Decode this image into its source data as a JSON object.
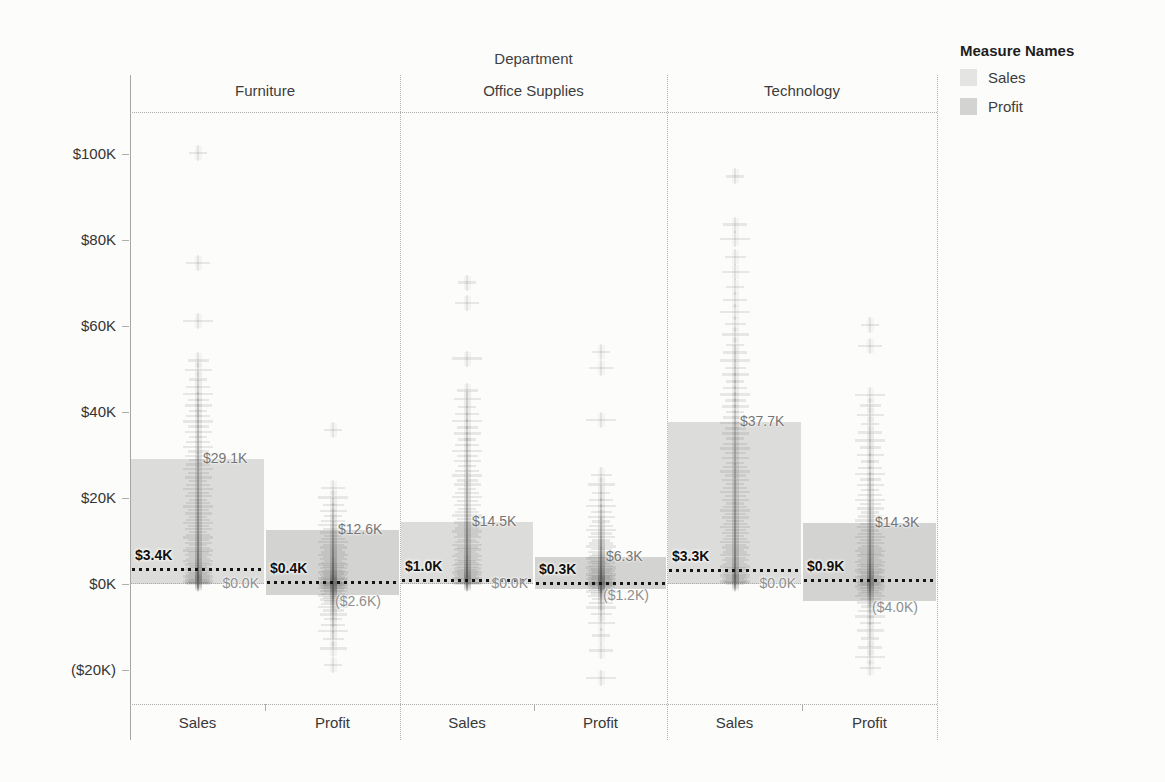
{
  "title": "Department",
  "legend": {
    "title": "Measure Names",
    "entries": [
      {
        "label": "Sales",
        "color": "#e4e4e3"
      },
      {
        "label": "Profit",
        "color": "#d3d3d2"
      }
    ]
  },
  "chart_data": {
    "type": "scatter",
    "title": "Department",
    "subtitle": "",
    "xlabel": "",
    "ylabel": "",
    "legend_position": "top-right",
    "grid": false,
    "ylim": [
      -28,
      110
    ],
    "y_axis": {
      "unit": "$K",
      "ticks": [
        {
          "value": 100,
          "label": "$100K"
        },
        {
          "value": 80,
          "label": "$80K"
        },
        {
          "value": 60,
          "label": "$60K"
        },
        {
          "value": 40,
          "label": "$40K"
        },
        {
          "value": 20,
          "label": "$20K"
        },
        {
          "value": 0,
          "label": "$0K"
        },
        {
          "value": -20,
          "label": "($20K)"
        }
      ]
    },
    "colors": {
      "sales_band": "#dcdcdb",
      "profit_band": "#d3d3d2",
      "mark": "90,90,90",
      "ref_line": "#151515"
    },
    "panels": [
      {
        "department": "Furniture",
        "measures": [
          {
            "name": "Sales",
            "band": {
              "top_value": 29.1,
              "top_label": "$29.1K",
              "bottom_value": 0.0,
              "bottom_label": "$0.0K"
            },
            "ref_line": {
              "value": 3.4,
              "label": "$3.4K"
            },
            "points": [
              100.2,
              74.6,
              61.2,
              52.0,
              49.8,
              47.6,
              45.8,
              44.2,
              42.8,
              41.5,
              40.2,
              39.0,
              37.8,
              36.6,
              35.4,
              34.2,
              33.0,
              31.9,
              30.8,
              29.8,
              28.8,
              27.8,
              26.8,
              25.8,
              24.8,
              23.9,
              23.0,
              22.1,
              21.2,
              20.4,
              19.6,
              18.8,
              18.0,
              17.2,
              16.4,
              15.6,
              14.9,
              14.2,
              13.5,
              12.8,
              12.1,
              11.4,
              10.8,
              10.2,
              9.6,
              9.0,
              8.4,
              7.8,
              7.3,
              6.8,
              6.3,
              5.8,
              5.3,
              4.9,
              4.5,
              4.1,
              3.7,
              3.3,
              2.9,
              2.6,
              2.3,
              2.0,
              1.7,
              1.4,
              1.2,
              1.0,
              0.8,
              0.6,
              0.4,
              0.3,
              0.2,
              0.1
            ]
          },
          {
            "name": "Profit",
            "band": {
              "top_value": 12.6,
              "top_label": "$12.6K",
              "bottom_value": -2.6,
              "bottom_label": "($2.6K)"
            },
            "ref_line": {
              "value": 0.4,
              "label": "$0.4K"
            },
            "points": [
              35.8,
              22.3,
              20.1,
              18.4,
              17.0,
              15.8,
              14.7,
              13.7,
              12.8,
              12.0,
              11.2,
              10.5,
              9.8,
              9.1,
              8.5,
              7.9,
              7.3,
              6.8,
              6.3,
              5.8,
              5.3,
              4.9,
              4.5,
              4.1,
              3.7,
              3.3,
              3.0,
              2.7,
              2.4,
              2.1,
              1.8,
              1.5,
              1.3,
              1.1,
              0.9,
              0.7,
              0.5,
              0.4,
              0.3,
              0.2,
              0.1,
              0.0,
              -0.1,
              -0.2,
              -0.4,
              -0.6,
              -0.8,
              -1.0,
              -1.3,
              -1.6,
              -1.9,
              -2.3,
              -2.7,
              -3.1,
              -3.6,
              -4.1,
              -4.7,
              -5.4,
              -6.2,
              -7.1,
              -8.2,
              -9.5,
              -11.0,
              -12.8,
              -15.0,
              -18.8
            ]
          }
        ]
      },
      {
        "department": "Office Supplies",
        "measures": [
          {
            "name": "Sales",
            "band": {
              "top_value": 14.5,
              "top_label": "$14.5K",
              "bottom_value": 0.0,
              "bottom_label": "$0.0K"
            },
            "ref_line": {
              "value": 1.0,
              "label": "$1.0K"
            },
            "points": [
              70.1,
              65.3,
              52.4,
              45.0,
              43.0,
              41.2,
              39.5,
              37.9,
              36.4,
              35.0,
              33.6,
              32.3,
              31.0,
              29.8,
              28.6,
              27.4,
              26.3,
              25.2,
              24.1,
              23.1,
              22.1,
              21.1,
              20.2,
              19.3,
              18.4,
              17.5,
              16.7,
              15.9,
              15.1,
              14.3,
              13.6,
              12.9,
              12.2,
              11.5,
              10.9,
              10.3,
              9.7,
              9.1,
              8.5,
              8.0,
              7.5,
              7.0,
              6.5,
              6.0,
              5.6,
              5.2,
              4.8,
              4.4,
              4.0,
              3.6,
              3.3,
              3.0,
              2.7,
              2.4,
              2.1,
              1.8,
              1.5,
              1.3,
              1.1,
              0.9,
              0.7,
              0.5,
              0.3,
              0.2,
              0.1
            ]
          },
          {
            "name": "Profit",
            "band": {
              "top_value": 6.3,
              "top_label": "$6.3K",
              "bottom_value": -1.2,
              "bottom_label": "($1.2K)"
            },
            "ref_line": {
              "value": 0.3,
              "label": "$0.3K"
            },
            "points": [
              54.0,
              50.3,
              38.2,
              25.4,
              23.1,
              21.2,
              19.6,
              18.1,
              16.8,
              15.6,
              14.5,
              13.5,
              12.6,
              11.7,
              10.9,
              10.1,
              9.4,
              8.7,
              8.1,
              7.5,
              6.9,
              6.4,
              5.9,
              5.4,
              5.0,
              4.6,
              4.2,
              3.8,
              3.4,
              3.1,
              2.8,
              2.5,
              2.2,
              1.9,
              1.7,
              1.5,
              1.3,
              1.1,
              0.9,
              0.7,
              0.5,
              0.4,
              0.3,
              0.2,
              0.1,
              0.0,
              -0.1,
              -0.3,
              -0.5,
              -0.7,
              -1.0,
              -1.3,
              -1.7,
              -2.2,
              -2.8,
              -3.5,
              -4.4,
              -5.5,
              -7.0,
              -9.0,
              -12.0,
              -15.5,
              -21.8
            ]
          }
        ]
      },
      {
        "department": "Technology",
        "measures": [
          {
            "name": "Sales",
            "band": {
              "top_value": 37.7,
              "top_label": "$37.7K",
              "bottom_value": 0.0,
              "bottom_label": "$0.0K"
            },
            "ref_line": {
              "value": 3.3,
              "label": "$3.3K"
            },
            "points": [
              94.8,
              83.6,
              80.2,
              76.0,
              72.5,
              69.0,
              66.0,
              63.2,
              60.5,
              58.0,
              55.6,
              53.8,
              52.0,
              50.3,
              48.7,
              47.1,
              45.6,
              44.1,
              42.7,
              41.3,
              40.0,
              38.7,
              37.4,
              36.2,
              35.0,
              33.8,
              32.6,
              31.5,
              30.4,
              29.3,
              28.2,
              27.2,
              26.2,
              25.2,
              24.2,
              23.2,
              22.3,
              21.4,
              20.5,
              19.6,
              18.7,
              17.9,
              17.1,
              16.3,
              15.5,
              14.7,
              13.9,
              13.2,
              12.5,
              11.8,
              11.1,
              10.4,
              9.7,
              9.1,
              8.5,
              7.9,
              7.3,
              6.7,
              6.1,
              5.6,
              5.1,
              4.6,
              4.1,
              3.6,
              3.2,
              2.8,
              2.4,
              2.0,
              1.7,
              1.4,
              1.1,
              0.8,
              0.6,
              0.4,
              0.2,
              0.1
            ]
          },
          {
            "name": "Profit",
            "band": {
              "top_value": 14.3,
              "top_label": "$14.3K",
              "bottom_value": -4.0,
              "bottom_label": "($4.0K)"
            },
            "ref_line": {
              "value": 0.9,
              "label": "$0.9K"
            },
            "points": [
              60.2,
              55.4,
              43.9,
              41.5,
              39.3,
              37.2,
              35.2,
              33.4,
              31.7,
              30.0,
              28.5,
              27.0,
              25.6,
              24.3,
              23.0,
              21.8,
              20.7,
              19.6,
              18.6,
              17.6,
              16.6,
              15.7,
              14.8,
              14.0,
              13.2,
              12.4,
              11.6,
              10.9,
              10.2,
              9.5,
              8.9,
              8.3,
              7.7,
              7.1,
              6.6,
              6.1,
              5.6,
              5.1,
              4.7,
              4.3,
              3.9,
              3.5,
              3.1,
              2.8,
              2.5,
              2.2,
              1.9,
              1.6,
              1.3,
              1.1,
              0.9,
              0.7,
              0.5,
              0.3,
              0.1,
              -0.1,
              -0.3,
              -0.6,
              -0.9,
              -1.3,
              -1.7,
              -2.2,
              -2.8,
              -3.5,
              -4.3,
              -5.2,
              -6.3,
              -7.6,
              -9.1,
              -10.8,
              -12.7,
              -14.8,
              -17.0,
              -19.5
            ]
          }
        ]
      }
    ]
  }
}
